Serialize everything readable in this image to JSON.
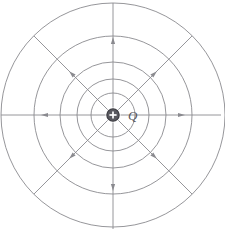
{
  "figure": {
    "background_color": "#ffffff",
    "line_color": "#8a8a8f",
    "charge_fill_color": "#5a5a60",
    "charge_symbol": "+",
    "charge_label": "Q",
    "center": {
      "x": 113,
      "y": 115
    },
    "equipotential_circles": [
      {
        "name": "circle-1",
        "radius": 22
      },
      {
        "name": "circle-2",
        "radius": 36
      },
      {
        "name": "circle-3",
        "radius": 53
      },
      {
        "name": "circle-4",
        "radius": 79
      },
      {
        "name": "circle-5",
        "radius": 112
      }
    ],
    "field_lines": [
      {
        "name": "field-line-up",
        "angle_deg": 270,
        "length": 112,
        "arrow_at": 78
      },
      {
        "name": "field-line-up-right",
        "angle_deg": 315,
        "length": 112,
        "arrow_at": 62
      },
      {
        "name": "field-line-right",
        "angle_deg": 0,
        "length": 108,
        "arrow_at": 72
      },
      {
        "name": "field-line-down-right",
        "angle_deg": 45,
        "length": 112,
        "arrow_at": 62
      },
      {
        "name": "field-line-down",
        "angle_deg": 90,
        "length": 114,
        "arrow_at": 76
      },
      {
        "name": "field-line-down-left",
        "angle_deg": 135,
        "length": 112,
        "arrow_at": 62
      },
      {
        "name": "field-line-left",
        "angle_deg": 180,
        "length": 112,
        "arrow_at": 72
      },
      {
        "name": "field-line-up-left",
        "angle_deg": 225,
        "length": 112,
        "arrow_at": 62
      }
    ],
    "arrow_size": {
      "length": 7,
      "width": 4.2
    }
  },
  "chart_data": {
    "type": "diagram",
    "center_charge": {
      "label": "Q",
      "sign": "+",
      "polarity": "positive"
    },
    "equipotential_radii": [
      22,
      36,
      53,
      79,
      112
    ],
    "field_line_angles_deg": [
      0,
      45,
      90,
      135,
      180,
      225,
      270,
      315
    ],
    "field_direction": "outward",
    "number_of_field_lines": 8,
    "number_of_equipotentials": 5
  }
}
